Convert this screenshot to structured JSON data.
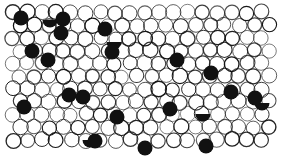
{
  "image": {
    "description": "Black-and-white ink illustration of a densely packed field of outlined circles with scattered solid black circles",
    "background": "#ffffff",
    "ink": "#111111",
    "art_bounds": {
      "x": 8,
      "y": 8,
      "width": 264,
      "height": 144
    },
    "circle_radius": 7.5,
    "black_circles": [
      [
        21,
        18
      ],
      [
        63,
        19
      ],
      [
        61,
        33
      ],
      [
        105,
        29
      ],
      [
        32,
        51
      ],
      [
        48,
        60
      ],
      [
        112,
        52
      ],
      [
        177,
        60
      ],
      [
        211,
        73
      ],
      [
        24,
        107
      ],
      [
        69,
        95
      ],
      [
        83,
        97
      ],
      [
        117,
        117
      ],
      [
        95,
        141
      ],
      [
        170,
        109
      ],
      [
        231,
        92
      ],
      [
        255,
        98
      ],
      [
        145,
        148
      ],
      [
        206,
        146
      ]
    ],
    "half_black_circles": [
      [
        114,
        42
      ],
      [
        50,
        20
      ],
      [
        203,
        114
      ],
      [
        262,
        103
      ],
      [
        90,
        140
      ]
    ]
  }
}
